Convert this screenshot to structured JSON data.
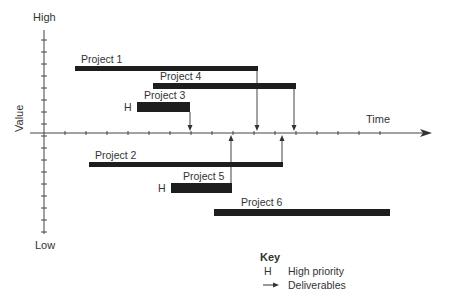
{
  "diagram": {
    "type": "project-portfolio-timeline",
    "y_axis": {
      "label": "Value",
      "top_label": "High",
      "bottom_label": "Low"
    },
    "x_axis": {
      "label": "Time"
    },
    "projects": [
      {
        "id": "p1",
        "label": "Project 1",
        "priority": "",
        "x1": 75,
        "x2": 258,
        "y": 66,
        "h": 5,
        "deliverable_x": 257
      },
      {
        "id": "p4",
        "label": "Project 4",
        "priority": "",
        "x1": 153,
        "x2": 296,
        "y": 83,
        "h": 6,
        "deliverable_x": 294
      },
      {
        "id": "p3",
        "label": "Project 3",
        "priority": "H",
        "x1": 137,
        "x2": 190,
        "y": 102,
        "h": 10,
        "deliverable_x": 190
      },
      {
        "id": "p2",
        "label": "Project 2",
        "priority": "",
        "x1": 89,
        "x2": 283,
        "y": 162,
        "h": 5,
        "deliverable_x": 282
      },
      {
        "id": "p5",
        "label": "Project 5",
        "priority": "H",
        "x1": 171,
        "x2": 232,
        "y": 183,
        "h": 10,
        "deliverable_x": 231
      },
      {
        "id": "p6",
        "label": "Project 6",
        "priority": "",
        "x1": 214,
        "x2": 390,
        "y": 209,
        "h": 7,
        "deliverable_x": null
      }
    ],
    "key": {
      "title": "Key",
      "items": [
        {
          "symbol": "H",
          "label": "High priority"
        },
        {
          "symbol": "arrow",
          "label": "Deliverables"
        }
      ]
    }
  }
}
